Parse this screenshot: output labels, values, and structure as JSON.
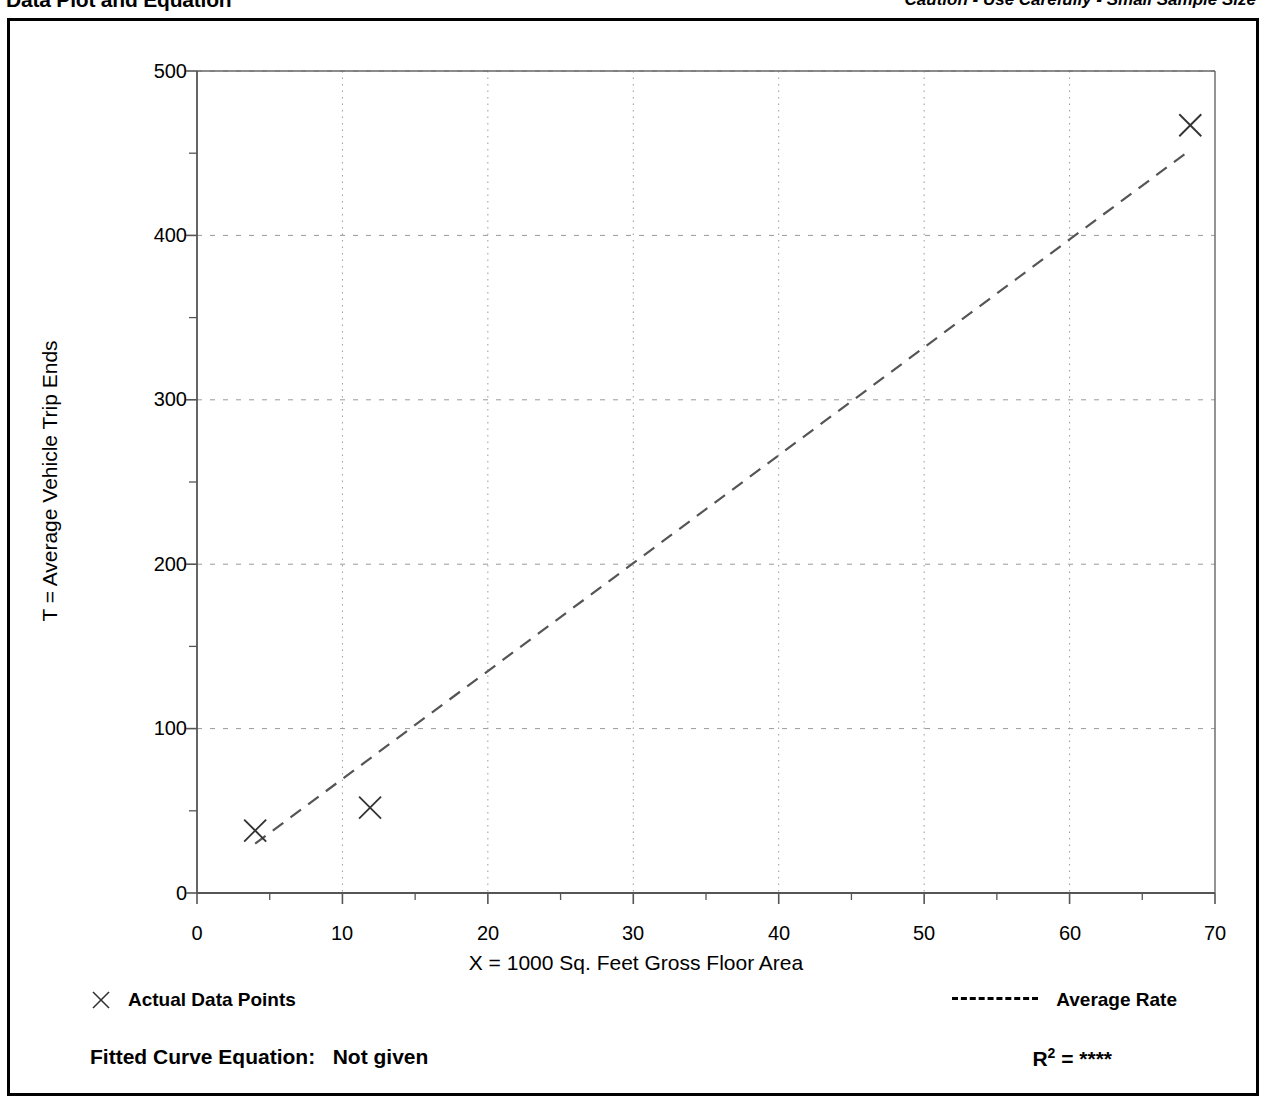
{
  "header": {
    "title": "Data Plot and Equation",
    "caution": "Caution - Use Carefully - Small Sample Size"
  },
  "legend": {
    "data_points_label": "Actual Data Points",
    "average_rate_label": "Average Rate",
    "marker_icon": "x-marker-icon",
    "line_icon": "dashed-line-icon"
  },
  "equation": {
    "fitted_curve_label": "Fitted Curve Equation:",
    "fitted_curve_value": "Not given",
    "r_symbol": "R",
    "r_exponent": "2",
    "r_equals": "=",
    "r_value": "****"
  },
  "colors": {
    "foreground": "#000000",
    "grid": "#9a9a9a",
    "axis": "#555555",
    "series": "#555555",
    "background": "#ffffff"
  },
  "chart_data": {
    "type": "scatter",
    "title": "Data Plot and Equation",
    "xlabel": "X = 1000 Sq. Feet Gross Floor Area",
    "ylabel": "T = Average Vehicle Trip Ends",
    "xlim": [
      0,
      70
    ],
    "ylim": [
      0,
      500
    ],
    "xticks": [
      0,
      10,
      20,
      30,
      40,
      50,
      60,
      70
    ],
    "xtick_labels": [
      "0",
      "10",
      "20",
      "30",
      "40",
      "50",
      "60",
      "70"
    ],
    "x_minor_ticks": [
      5,
      15,
      25,
      35,
      45,
      55,
      65
    ],
    "yticks": [
      0,
      100,
      200,
      300,
      400,
      500
    ],
    "ytick_labels": [
      "0",
      "100",
      "200",
      "300",
      "400",
      "500"
    ],
    "y_minor_ticks": [
      50,
      150,
      250,
      350,
      450
    ],
    "grid": true,
    "grid_style": "dotted",
    "legend_position": "below-plot",
    "series": [
      {
        "name": "Actual Data Points",
        "type": "scatter",
        "marker": "x",
        "points": [
          {
            "x": 4.0,
            "y": 38
          },
          {
            "x": 11.9,
            "y": 52
          },
          {
            "x": 68.3,
            "y": 467
          }
        ]
      },
      {
        "name": "Average Rate",
        "type": "line",
        "style": "dashed",
        "points": [
          {
            "x": 4.0,
            "y": 30
          },
          {
            "x": 68.0,
            "y": 450
          }
        ]
      }
    ]
  }
}
